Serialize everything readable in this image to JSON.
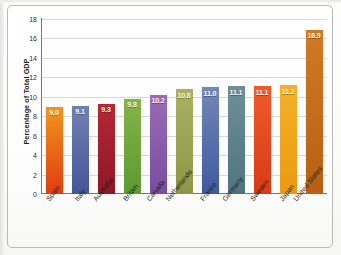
{
  "chart_data": {
    "type": "bar",
    "title": "",
    "xlabel": "",
    "ylabel": "Percentage of Total GDP",
    "ylim": [
      0,
      18
    ],
    "yticks": [
      0,
      2,
      4,
      6,
      8,
      10,
      12,
      14,
      16,
      18
    ],
    "ytick_labels": [
      "0",
      "2",
      "4",
      "6",
      "8",
      "10",
      "12",
      "14",
      "16",
      "18"
    ],
    "grid": "horizontal",
    "legend": "none",
    "categories": [
      "Spain",
      "Italy",
      "Australia",
      "Britain",
      "Canada",
      "Netherlands",
      "France",
      "Germany",
      "Sweden",
      "Japan",
      "United States"
    ],
    "values": [
      9.0,
      9.1,
      9.3,
      9.8,
      10.2,
      10.8,
      11.0,
      11.1,
      11.1,
      11.2,
      16.9
    ],
    "value_labels": [
      "9.0",
      "9.1",
      "9.3",
      "9.8",
      "10.2",
      "10.8",
      "11.0",
      "11.1",
      "11.1",
      "11.2",
      "16.9"
    ],
    "bar_colors_top": [
      "#f2951f",
      "#6f82b4",
      "#b52836",
      "#84b44a",
      "#9a6cb4",
      "#a9b263",
      "#7288b6",
      "#6e8f97",
      "#ef5a2a",
      "#f5b02a",
      "#cf7a24"
    ],
    "bar_colors_bottom": [
      "#e03c10",
      "#46549a",
      "#8e1725",
      "#5d9a31",
      "#7a4ba0",
      "#8c9644",
      "#3e59a0",
      "#4e757f",
      "#d93a16",
      "#eb9a10",
      "#b85f12"
    ]
  }
}
